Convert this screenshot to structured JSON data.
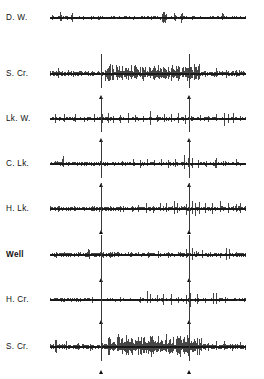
{
  "figure": {
    "type": "multichannel-seismogram",
    "background_color": "#ffffff",
    "trace_color": "#0a0a0a",
    "marker_color": "#3a3a3a",
    "width": 264,
    "height": 379,
    "trace_left": 50,
    "trace_width": 196,
    "marker_positions_px": [
      101,
      189
    ]
  },
  "traces": [
    {
      "label": "D. W.",
      "bold": false,
      "label_y": 18,
      "baseline_y": 18,
      "height": 30,
      "amplitude": 7,
      "noise": 0.35,
      "bursts": [],
      "spikes": [
        {
          "x": 2,
          "a": 0.55
        },
        {
          "x": 10,
          "a": 0.95
        },
        {
          "x": 11,
          "a": 0.7
        },
        {
          "x": 21,
          "a": 1.0
        },
        {
          "x": 22,
          "a": 0.8
        },
        {
          "x": 33,
          "a": 0.45
        },
        {
          "x": 41,
          "a": 0.5
        },
        {
          "x": 52,
          "a": 0.35
        },
        {
          "x": 63,
          "a": 0.4
        },
        {
          "x": 74,
          "a": 0.3
        },
        {
          "x": 86,
          "a": 0.35
        },
        {
          "x": 96,
          "a": 0.3
        },
        {
          "x": 101,
          "a": 0.35
        },
        {
          "x": 104,
          "a": 0.3
        },
        {
          "x": 112,
          "a": 0.85
        },
        {
          "x": 113,
          "a": 1.0
        },
        {
          "x": 114,
          "a": 0.9
        },
        {
          "x": 115,
          "a": 0.95
        },
        {
          "x": 116,
          "a": 0.7
        },
        {
          "x": 124,
          "a": 0.9
        },
        {
          "x": 125,
          "a": 0.75
        },
        {
          "x": 131,
          "a": 0.95
        },
        {
          "x": 132,
          "a": 0.8
        },
        {
          "x": 142,
          "a": 0.35
        },
        {
          "x": 152,
          "a": 0.3
        },
        {
          "x": 163,
          "a": 0.35
        },
        {
          "x": 172,
          "a": 0.75
        },
        {
          "x": 173,
          "a": 0.6
        },
        {
          "x": 182,
          "a": 0.3
        },
        {
          "x": 190,
          "a": 0.3
        }
      ],
      "show_markers": false,
      "marker_line_top": 0,
      "marker_line_bottom": 0,
      "show_triangles": false
    },
    {
      "label": "S. Cr.",
      "bold": false,
      "label_y": 74,
      "baseline_y": 74,
      "height": 44,
      "amplitude": 13,
      "noise": 0.3,
      "bursts": [
        {
          "start": 55,
          "end": 150,
          "density": 0.92,
          "amp": 0.95
        }
      ],
      "spikes": [
        {
          "x": 8,
          "a": 0.5
        },
        {
          "x": 18,
          "a": 0.3
        },
        {
          "x": 30,
          "a": 0.28
        },
        {
          "x": 42,
          "a": 0.3
        },
        {
          "x": 51,
          "a": 0.35
        },
        {
          "x": 155,
          "a": 0.4
        },
        {
          "x": 166,
          "a": 0.5
        },
        {
          "x": 176,
          "a": 0.45
        },
        {
          "x": 186,
          "a": 0.4
        },
        {
          "x": 192,
          "a": 0.3
        }
      ],
      "show_markers": true,
      "marker_line_top": -20,
      "marker_line_bottom": 14,
      "show_triangles": true
    },
    {
      "label": "Lk. W.",
      "bold": false,
      "label_y": 119,
      "baseline_y": 119,
      "height": 40,
      "amplitude": 12,
      "noise": 0.22,
      "bursts": [],
      "spikes": [
        {
          "x": 5,
          "a": 0.45
        },
        {
          "x": 14,
          "a": 0.4
        },
        {
          "x": 25,
          "a": 0.5
        },
        {
          "x": 34,
          "a": 0.42
        },
        {
          "x": 44,
          "a": 0.4
        },
        {
          "x": 51,
          "a": 0.95
        },
        {
          "x": 52,
          "a": 0.7
        },
        {
          "x": 58,
          "a": 0.75
        },
        {
          "x": 63,
          "a": 0.5
        },
        {
          "x": 70,
          "a": 0.45
        },
        {
          "x": 78,
          "a": 0.55
        },
        {
          "x": 85,
          "a": 0.4
        },
        {
          "x": 93,
          "a": 0.5
        },
        {
          "x": 100,
          "a": 0.85
        },
        {
          "x": 107,
          "a": 0.6
        },
        {
          "x": 114,
          "a": 0.8
        },
        {
          "x": 121,
          "a": 0.55
        },
        {
          "x": 128,
          "a": 0.9
        },
        {
          "x": 135,
          "a": 0.6
        },
        {
          "x": 141,
          "a": 0.5
        },
        {
          "x": 150,
          "a": 0.45
        },
        {
          "x": 158,
          "a": 0.5
        },
        {
          "x": 166,
          "a": 0.45
        },
        {
          "x": 174,
          "a": 0.8
        },
        {
          "x": 178,
          "a": 0.85
        },
        {
          "x": 183,
          "a": 0.6
        },
        {
          "x": 190,
          "a": 0.4
        }
      ],
      "show_markers": true,
      "marker_line_top": -22,
      "marker_line_bottom": 13,
      "show_triangles": true
    },
    {
      "label": "C. Lk.",
      "bold": false,
      "label_y": 164,
      "baseline_y": 164,
      "height": 40,
      "amplitude": 11,
      "noise": 0.25,
      "bursts": [],
      "spikes": [
        {
          "x": 12,
          "a": 0.55
        },
        {
          "x": 13,
          "a": 0.75
        },
        {
          "x": 24,
          "a": 0.35
        },
        {
          "x": 34,
          "a": 0.3
        },
        {
          "x": 44,
          "a": 0.3
        },
        {
          "x": 51,
          "a": 0.45
        },
        {
          "x": 62,
          "a": 0.3
        },
        {
          "x": 72,
          "a": 0.3
        },
        {
          "x": 83,
          "a": 0.5
        },
        {
          "x": 90,
          "a": 0.45
        },
        {
          "x": 97,
          "a": 0.55
        },
        {
          "x": 104,
          "a": 0.5
        },
        {
          "x": 111,
          "a": 0.6
        },
        {
          "x": 118,
          "a": 0.55
        },
        {
          "x": 125,
          "a": 0.65
        },
        {
          "x": 134,
          "a": 0.85
        },
        {
          "x": 138,
          "a": 0.7
        },
        {
          "x": 142,
          "a": 0.6
        },
        {
          "x": 148,
          "a": 0.55
        },
        {
          "x": 156,
          "a": 0.45
        },
        {
          "x": 165,
          "a": 0.75
        },
        {
          "x": 166,
          "a": 0.6
        },
        {
          "x": 175,
          "a": 0.5
        },
        {
          "x": 186,
          "a": 0.6
        }
      ],
      "show_markers": true,
      "marker_line_top": -24,
      "marker_line_bottom": 14,
      "show_triangles": true
    },
    {
      "label": "H. Lk.",
      "bold": false,
      "label_y": 209,
      "baseline_y": 209,
      "height": 44,
      "amplitude": 12,
      "noise": 0.28,
      "bursts": [],
      "spikes": [
        {
          "x": 8,
          "a": 0.3
        },
        {
          "x": 20,
          "a": 0.28
        },
        {
          "x": 32,
          "a": 0.3
        },
        {
          "x": 44,
          "a": 0.3
        },
        {
          "x": 51,
          "a": 0.4
        },
        {
          "x": 60,
          "a": 0.3
        },
        {
          "x": 70,
          "a": 0.45
        },
        {
          "x": 73,
          "a": 0.5
        },
        {
          "x": 82,
          "a": 0.5
        },
        {
          "x": 88,
          "a": 0.45
        },
        {
          "x": 96,
          "a": 0.6
        },
        {
          "x": 103,
          "a": 0.5
        },
        {
          "x": 110,
          "a": 0.55
        },
        {
          "x": 116,
          "a": 0.5
        },
        {
          "x": 124,
          "a": 0.75
        },
        {
          "x": 127,
          "a": 0.6
        },
        {
          "x": 136,
          "a": 0.9
        },
        {
          "x": 139,
          "a": 0.85
        },
        {
          "x": 142,
          "a": 0.95
        },
        {
          "x": 145,
          "a": 0.8
        },
        {
          "x": 149,
          "a": 0.7
        },
        {
          "x": 155,
          "a": 0.6
        },
        {
          "x": 162,
          "a": 0.55
        },
        {
          "x": 170,
          "a": 0.65
        },
        {
          "x": 178,
          "a": 0.5
        },
        {
          "x": 186,
          "a": 0.7
        },
        {
          "x": 190,
          "a": 0.55
        }
      ],
      "show_markers": true,
      "marker_line_top": -26,
      "marker_line_bottom": 22,
      "show_triangles": true
    },
    {
      "label": "Well",
      "bold": true,
      "label_y": 255,
      "baseline_y": 255,
      "height": 48,
      "amplitude": 10,
      "noise": 0.3,
      "bursts": [],
      "spikes": [
        {
          "x": 6,
          "a": 0.4
        },
        {
          "x": 17,
          "a": 0.35
        },
        {
          "x": 28,
          "a": 0.4
        },
        {
          "x": 38,
          "a": 0.75
        },
        {
          "x": 39,
          "a": 0.6
        },
        {
          "x": 45,
          "a": 0.45
        },
        {
          "x": 51,
          "a": 0.85
        },
        {
          "x": 53,
          "a": 0.6
        },
        {
          "x": 60,
          "a": 0.5
        },
        {
          "x": 68,
          "a": 0.4
        },
        {
          "x": 78,
          "a": 0.35
        },
        {
          "x": 88,
          "a": 0.4
        },
        {
          "x": 98,
          "a": 0.5
        },
        {
          "x": 108,
          "a": 0.45
        },
        {
          "x": 118,
          "a": 0.4
        },
        {
          "x": 128,
          "a": 0.35
        },
        {
          "x": 136,
          "a": 0.6
        },
        {
          "x": 139,
          "a": 0.85
        },
        {
          "x": 142,
          "a": 0.7
        },
        {
          "x": 146,
          "a": 0.55
        },
        {
          "x": 152,
          "a": 0.5
        },
        {
          "x": 160,
          "a": 0.4
        },
        {
          "x": 170,
          "a": 0.45
        },
        {
          "x": 176,
          "a": 0.8
        },
        {
          "x": 179,
          "a": 0.65
        },
        {
          "x": 186,
          "a": 0.4
        },
        {
          "x": 192,
          "a": 0.35
        }
      ],
      "show_markers": true,
      "marker_line_top": -20,
      "marker_line_bottom": 40,
      "show_triangles": true
    },
    {
      "label": "H. Cr.",
      "bold": false,
      "label_y": 300,
      "baseline_y": 300,
      "height": 42,
      "amplitude": 11,
      "noise": 0.22,
      "bursts": [],
      "spikes": [
        {
          "x": 6,
          "a": 0.35
        },
        {
          "x": 18,
          "a": 0.3
        },
        {
          "x": 30,
          "a": 0.3
        },
        {
          "x": 42,
          "a": 0.35
        },
        {
          "x": 51,
          "a": 0.55
        },
        {
          "x": 60,
          "a": 0.3
        },
        {
          "x": 70,
          "a": 0.3
        },
        {
          "x": 80,
          "a": 0.3
        },
        {
          "x": 90,
          "a": 0.45
        },
        {
          "x": 97,
          "a": 0.85
        },
        {
          "x": 100,
          "a": 0.7
        },
        {
          "x": 107,
          "a": 0.55
        },
        {
          "x": 113,
          "a": 0.6
        },
        {
          "x": 121,
          "a": 0.65
        },
        {
          "x": 128,
          "a": 0.55
        },
        {
          "x": 136,
          "a": 0.85
        },
        {
          "x": 140,
          "a": 0.9
        },
        {
          "x": 147,
          "a": 0.6
        },
        {
          "x": 155,
          "a": 0.45
        },
        {
          "x": 163,
          "a": 0.8
        },
        {
          "x": 166,
          "a": 0.65
        },
        {
          "x": 175,
          "a": 0.4
        },
        {
          "x": 185,
          "a": 0.35
        }
      ],
      "show_markers": true,
      "marker_line_top": -24,
      "marker_line_bottom": 13,
      "show_triangles": true
    },
    {
      "label": "S. Cr.",
      "bold": false,
      "label_y": 347,
      "baseline_y": 347,
      "height": 48,
      "amplitude": 14,
      "noise": 0.28,
      "bursts": [
        {
          "start": 58,
          "end": 152,
          "density": 0.95,
          "amp": 1.0
        }
      ],
      "spikes": [
        {
          "x": 5,
          "a": 0.7
        },
        {
          "x": 6,
          "a": 0.55
        },
        {
          "x": 16,
          "a": 0.45
        },
        {
          "x": 28,
          "a": 0.35
        },
        {
          "x": 40,
          "a": 0.4
        },
        {
          "x": 51,
          "a": 0.6
        },
        {
          "x": 158,
          "a": 0.55
        },
        {
          "x": 166,
          "a": 0.5
        },
        {
          "x": 174,
          "a": 0.45
        },
        {
          "x": 182,
          "a": 0.4
        },
        {
          "x": 190,
          "a": 0.5
        }
      ],
      "show_markers": true,
      "marker_line_top": -48,
      "marker_line_bottom": 14,
      "show_triangles": true
    }
  ]
}
